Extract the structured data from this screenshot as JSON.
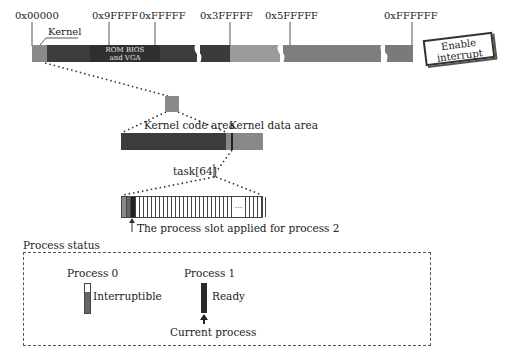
{
  "memory_map": {
    "addresses": [
      {
        "label": "0x00000",
        "x": 15,
        "tick_x": 32
      },
      {
        "label": "0x9FFFF",
        "x": 92,
        "tick_x": 109
      },
      {
        "label": "0xFFFFF",
        "x": 140,
        "tick_x": 155
      },
      {
        "label": "0x3FFFFF",
        "x": 200,
        "tick_x": 230
      },
      {
        "label": "0x5FFFFF",
        "x": 265,
        "tick_x": 290
      },
      {
        "label": "0xFFFFFF",
        "x": 385,
        "tick_x": 412
      }
    ],
    "kernel_label": "Kernel",
    "rom_bios_label_line1": "ROM BIOS",
    "rom_bios_label_line2": "and VGA"
  },
  "enable_interrupt": {
    "line1": "Enable",
    "line2": "interrupt"
  },
  "kernel_detail": {
    "code_area_label": "Kernel code area",
    "data_area_label": "Kernel data area"
  },
  "task_array": {
    "label": "task[64]",
    "ellipsis": "...",
    "slot_caption": "The process slot applied for process 2"
  },
  "process_status": {
    "title": "Process status",
    "processes": [
      {
        "name": "Process 0",
        "state": "Interruptible"
      },
      {
        "name": "Process 1",
        "state": "Ready"
      }
    ],
    "current_process_label": "Current process"
  },
  "colors": {
    "kernel_light": "#8a8a8a",
    "dark_region": "#3a3a3a",
    "rom_bios": "#2e2e2e",
    "mid_gray": "#9a9a9a",
    "gray": "#7c7c7c",
    "code_area": "#3c3c3c",
    "data_area": "#888888"
  }
}
